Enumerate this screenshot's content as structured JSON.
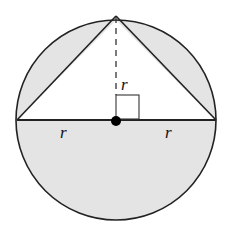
{
  "diagram": {
    "colors": {
      "shade": "#e4e4e4",
      "stroke": "#222222",
      "background": "#ffffff"
    },
    "labels": {
      "left_radius": "r",
      "right_radius": "r",
      "height": "r"
    }
  }
}
